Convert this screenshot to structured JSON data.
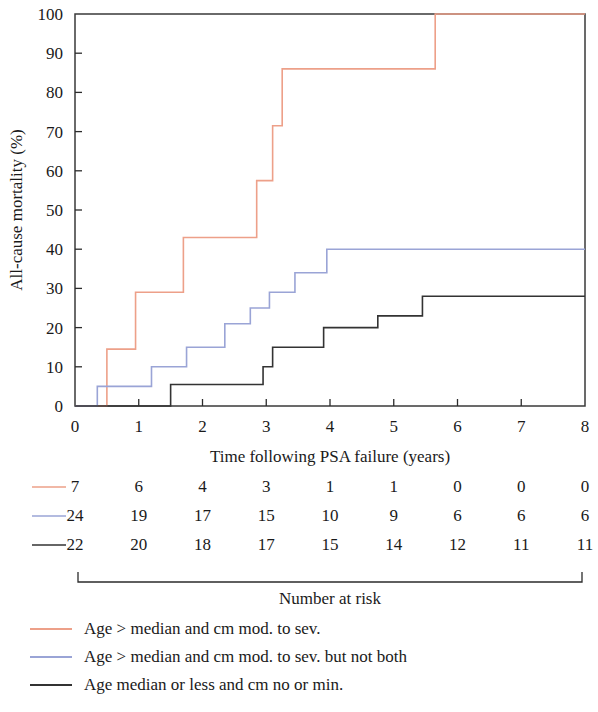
{
  "chart_data": {
    "type": "line",
    "subtype": "kaplan-meier-step",
    "title": "",
    "xlabel": "Time following PSA failure (years)",
    "ylabel": "All-cause mortality (%)",
    "xlim": [
      0,
      8
    ],
    "ylim": [
      0,
      100
    ],
    "xticks": [
      0,
      1,
      2,
      3,
      4,
      5,
      6,
      7,
      8
    ],
    "xticklabels": [
      "0",
      "1",
      "2",
      "3",
      "4",
      "5",
      "6",
      "7",
      "8"
    ],
    "yticks": [
      0,
      10,
      20,
      30,
      40,
      50,
      60,
      70,
      80,
      90,
      100
    ],
    "yticklabels": [
      "0",
      "10",
      "20",
      "30",
      "40",
      "50",
      "60",
      "70",
      "80",
      "90",
      "100"
    ],
    "grid": false,
    "legend_position": "below-plot",
    "series": [
      {
        "name": "Age > median and cm mod. to sev.",
        "color": "#EDA089",
        "x": [
          0,
          0.5,
          0.5,
          0.95,
          0.95,
          1.7,
          1.7,
          2.85,
          2.85,
          3.1,
          3.1,
          3.25,
          3.25,
          5.65,
          5.65,
          8
        ],
        "y": [
          0,
          0,
          14.5,
          14.5,
          29,
          29,
          43,
          43,
          57.5,
          57.5,
          71.5,
          71.5,
          86,
          86,
          100,
          100
        ]
      },
      {
        "name": "Age > median and cm mod. to sev. but not both",
        "color": "#9AA4D6",
        "x": [
          0,
          0.35,
          0.35,
          1.2,
          1.2,
          1.75,
          1.75,
          2.35,
          2.35,
          2.75,
          2.75,
          3.05,
          3.05,
          3.45,
          3.45,
          3.95,
          3.95,
          8
        ],
        "y": [
          0,
          0,
          5,
          5,
          10,
          10,
          15,
          15,
          21,
          21,
          25,
          25,
          29,
          29,
          34,
          34,
          40,
          40
        ]
      },
      {
        "name": "Age median or less and cm no or min.",
        "color": "#333333",
        "x": [
          0,
          1.5,
          1.5,
          2.95,
          2.95,
          3.1,
          3.1,
          3.9,
          3.9,
          4.75,
          4.75,
          5.45,
          5.45,
          8
        ],
        "y": [
          0,
          0,
          5.5,
          5.5,
          10,
          10,
          15,
          15,
          20,
          20,
          23,
          23,
          28,
          28
        ]
      }
    ]
  },
  "risk_table": {
    "bracket_label": "Number at risk",
    "time_points": [
      0,
      1,
      2,
      3,
      4,
      5,
      6,
      7,
      8
    ],
    "rows": [
      {
        "color": "#EDA089",
        "series": "Age > median and cm mod. to sev.",
        "counts": [
          "7",
          "6",
          "4",
          "3",
          "1",
          "1",
          "0",
          "0",
          "0"
        ]
      },
      {
        "color": "#9AA4D6",
        "series": "Age > median and cm mod. to sev. but not both",
        "counts": [
          "24",
          "19",
          "17",
          "15",
          "10",
          "9",
          "6",
          "6",
          "6"
        ]
      },
      {
        "color": "#333333",
        "series": "Age median or less and cm no or min.",
        "counts": [
          "22",
          "20",
          "18",
          "17",
          "15",
          "14",
          "12",
          "11",
          "11"
        ]
      }
    ]
  },
  "legend": {
    "items": [
      {
        "label": "Age > median and cm mod. to sev.",
        "color": "#EDA089"
      },
      {
        "label": "Age > median and cm mod. to sev. but not both",
        "color": "#9AA4D6"
      },
      {
        "label": "Age median or less and cm no or min.",
        "color": "#333333"
      }
    ]
  }
}
